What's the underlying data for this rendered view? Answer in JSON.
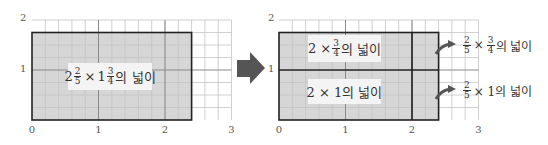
{
  "left_panel": {
    "x_ticks": [
      "0",
      "1",
      "2",
      "3"
    ],
    "y_ticks": [
      "1",
      "2"
    ],
    "label": {
      "whole1": "2",
      "num1": "2",
      "den1": "5",
      "times": "×",
      "whole2": "1",
      "num2": "3",
      "den2": "4",
      "suffix": "의 넓이"
    },
    "shaded_width": 2.4,
    "shaded_height": 1.75
  },
  "arrow": {
    "icon": "right-arrow-icon",
    "color": "#555555"
  },
  "right_panel": {
    "x_ticks": [
      "0",
      "1",
      "2",
      "3"
    ],
    "y_ticks": [
      "1",
      "2"
    ],
    "upper_label": {
      "prefix": "2 ×",
      "num": "3",
      "den": "4",
      "suffix": "의 넓이"
    },
    "lower_label": {
      "text": "2 × 1의 넓이"
    },
    "side_upper": {
      "num": "2",
      "den": "5",
      "times": "×",
      "num2": "3",
      "den2": "4",
      "suffix": "의 넓이"
    },
    "side_lower": {
      "num": "2",
      "den": "5",
      "rest": "× 1의 넓이"
    }
  },
  "colors": {
    "shade": "#d6d6d6",
    "grid": "#bdbdbd",
    "border": "#222222",
    "label_bg": "#f4f4f4"
  }
}
